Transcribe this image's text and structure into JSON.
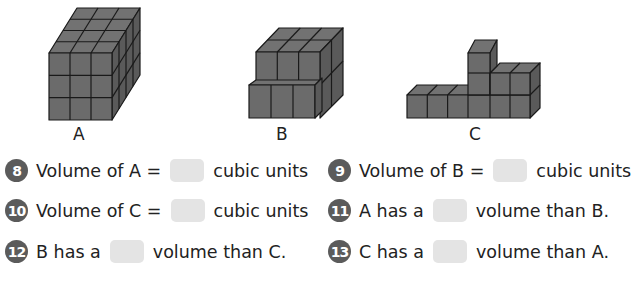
{
  "figures": [
    {
      "id": "A",
      "label": "A",
      "description": "3 x 3 x 4 block of cubes"
    },
    {
      "id": "B",
      "label": "B",
      "description": "stepped block of cubes"
    },
    {
      "id": "C",
      "label": "C",
      "description": "L-shaped row of cubes with tower"
    }
  ],
  "colors": {
    "cube_fill": "#6b6b6b",
    "cube_top": "#767676",
    "cube_side": "#5a5a5a",
    "badge": "#5b5b5b",
    "answer_box": "#e4e4e4"
  },
  "questions": [
    {
      "number": "8",
      "before": "Volume of A =",
      "after": "cubic units"
    },
    {
      "number": "9",
      "before": "Volume of B =",
      "after": "cubic units"
    },
    {
      "number": "10",
      "before": "Volume of C =",
      "after": "cubic units"
    },
    {
      "number": "11",
      "before": "A has a",
      "after": "volume than B."
    },
    {
      "number": "12",
      "before": "B has a",
      "after": "volume than C."
    },
    {
      "number": "13",
      "before": "C has a",
      "after": "volume than A."
    }
  ]
}
